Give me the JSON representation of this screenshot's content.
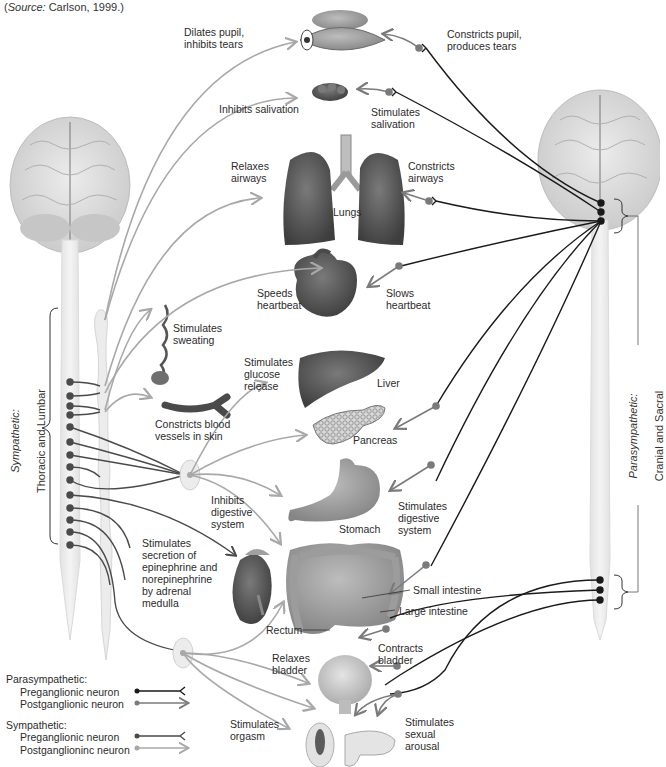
{
  "source": {
    "prefix": "(",
    "italic": "Source:",
    "rest": " Carlson, 1999.)"
  },
  "side_labels": {
    "sympathetic": {
      "title": "Sympathetic:",
      "subtitle": "Thoracic and Lumbar"
    },
    "parasympathetic": {
      "title": "Parasympathetic:",
      "subtitle": "Cranial and Sacral"
    }
  },
  "organs": {
    "eye": "eye",
    "salivary": "salivary gland",
    "lungs": "Lungs",
    "heart": "heart",
    "sweat": "sweat gland",
    "vessel": "blood vessel",
    "liver": "Liver",
    "pancreas": "Pancreas",
    "stomach": "Stomach",
    "adrenal": "adrenal gland",
    "small_intestine": "Small intestine",
    "large_intestine": "Large intestine",
    "rectum": "Rectum",
    "bladder": "bladder",
    "genitals": "genitals"
  },
  "sympathetic_effects": {
    "eye": "Dilates pupil,\ninhibits tears",
    "salivary": "Inhibits salivation",
    "lungs": "Relaxes\nairways",
    "heart": "Speeds\nheartbeat",
    "sweat": "Stimulates\nsweating",
    "vessel": "Constricts blood\nvessels in skin",
    "liver": "Stimulates\nglucose\nrelease",
    "digestive": "Inhibits\ndigestive\nsystem",
    "adrenal": "Stimulates\nsecretion of\nepinephrine and\nnorepinephrine\nby adrenal\nmedulla",
    "bladder": "Relaxes\nbladder",
    "orgasm": "Stimulates\norgasm"
  },
  "parasympathetic_effects": {
    "eye": "Constricts pupil,\nproduces tears",
    "salivary": "Stimulates\nsalivation",
    "lungs": "Constricts\nairways",
    "heart": "Slows\nheartbeat",
    "digestive": "Stimulates\ndigestive\nsystem",
    "bladder": "Contracts\nbladder",
    "arousal": "Stimulates\nsexual\narousal"
  },
  "legend": {
    "parasympathetic": {
      "title": "Parasympathetic:",
      "pre": "Preganglionic neuron",
      "post": "Postganglionic neuron"
    },
    "sympathetic": {
      "title": "Sympathetic:",
      "pre": "Preganglionic neuron",
      "post": "Postganglioninc neuron"
    }
  },
  "colors": {
    "parasympathetic_pre": "#1a1a1a",
    "parasympathetic_post": "#7a7a7a",
    "sympathetic_pre": "#4a4a4a",
    "sympathetic_post": "#a8a8a8",
    "brain": "#dcdcdc",
    "spinal_cord": "#ececec",
    "organ_dark": "#5a5a5a",
    "organ_mid": "#8c8c8c",
    "organ_light": "#c8c8c8"
  }
}
